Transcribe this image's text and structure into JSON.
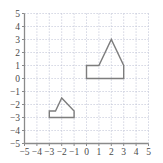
{
  "chart_data": {
    "type": "scatter",
    "title": "",
    "xlabel": "",
    "ylabel": "",
    "xlim": [
      -5,
      5
    ],
    "ylim": [
      -5,
      5
    ],
    "grid": true,
    "grid_style": "dotted",
    "legend": "none",
    "xticks": [
      -5,
      -4,
      -3,
      -2,
      -1,
      0,
      1,
      2,
      3,
      4,
      5
    ],
    "yticks": [
      -5,
      -4,
      -3,
      -2,
      -1,
      0,
      1,
      2,
      3,
      4,
      5
    ],
    "xtick_labels": [
      "−5",
      "−4",
      "−3",
      "−2",
      "−1",
      "0",
      "1",
      "2",
      "3",
      "4",
      "5"
    ],
    "ytick_labels": [
      "5",
      "4",
      "3",
      "2",
      "1",
      "0",
      "−1",
      "−2",
      "−3",
      "−4",
      "−5"
    ],
    "series": [
      {
        "name": "large-polygon",
        "type": "polygon",
        "closed": true,
        "stroke": "#7d7d7d",
        "fill": "none",
        "points": [
          [
            0,
            0
          ],
          [
            0,
            1
          ],
          [
            1,
            1
          ],
          [
            2,
            3
          ],
          [
            3,
            1
          ],
          [
            3,
            0
          ]
        ]
      },
      {
        "name": "small-polygon",
        "type": "polygon",
        "closed": true,
        "stroke": "#7d7d7d",
        "fill": "none",
        "points": [
          [
            -3,
            -3
          ],
          [
            -3,
            -2.5
          ],
          [
            -2.5,
            -2.5
          ],
          [
            -2,
            -1.5
          ],
          [
            -1,
            -2.5
          ],
          [
            -1,
            -3
          ]
        ]
      }
    ]
  },
  "style": {
    "axis_color": "#8a8a8a",
    "grid_color": "#b9bcd0",
    "shape_color": "#7d7d7d",
    "tick_label_color": "#4a4a4a",
    "background": "#ffffff"
  }
}
